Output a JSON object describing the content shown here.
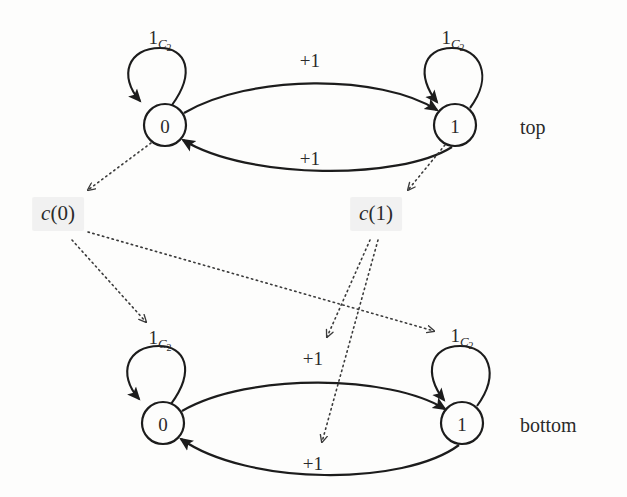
{
  "figure": {
    "type": "diagram",
    "background_color": "#fdfdfc",
    "ink_color": "#1c1c1c",
    "highlight_color": "#e8e8e8"
  },
  "graphs": [
    {
      "id": "top",
      "caption": "top",
      "caption_pos": {
        "x": 520,
        "y": 127
      },
      "nodes": [
        {
          "id": "top-0",
          "label": "0",
          "x": 165,
          "y": 125,
          "r": 21
        },
        {
          "id": "top-1",
          "label": "1",
          "x": 455,
          "y": 125,
          "r": 21
        }
      ],
      "self_loops": [
        {
          "id": "top-0-loop",
          "node": "top-0",
          "label": {
            "base": "1",
            "sub": "C",
            "subsub": "2"
          },
          "label_pos": {
            "x": 160,
            "y": 40
          }
        },
        {
          "id": "top-1-loop",
          "node": "top-1",
          "label": {
            "base": "1",
            "sub": "C",
            "subsub": "2"
          },
          "label_pos": {
            "x": 453,
            "y": 40
          }
        }
      ],
      "edges": [
        {
          "id": "top-0-to-1",
          "from": "top-0",
          "to": "top-1",
          "label": "+1",
          "label_pos": {
            "x": 310,
            "y": 60
          },
          "curve": "upper"
        },
        {
          "id": "top-1-to-0",
          "from": "top-1",
          "to": "top-0",
          "label": "+1",
          "label_pos": {
            "x": 310,
            "y": 158
          },
          "curve": "lower"
        }
      ]
    },
    {
      "id": "bottom",
      "caption": "bottom",
      "caption_pos": {
        "x": 520,
        "y": 425
      },
      "nodes": [
        {
          "id": "bot-0",
          "label": "0",
          "x": 163,
          "y": 423,
          "r": 21
        },
        {
          "id": "bot-1",
          "label": "1",
          "x": 462,
          "y": 423,
          "r": 21
        }
      ],
      "self_loops": [
        {
          "id": "bot-0-loop",
          "node": "bot-0",
          "label": {
            "base": "1",
            "sub": "C",
            "subsub": "2"
          },
          "label_pos": {
            "x": 160,
            "y": 340
          }
        },
        {
          "id": "bot-1-loop",
          "node": "bot-1",
          "label": {
            "base": "1",
            "sub": "C",
            "subsub": "2"
          },
          "label_pos": {
            "x": 462,
            "y": 338
          }
        }
      ],
      "edges": [
        {
          "id": "bot-0-to-1",
          "from": "bot-0",
          "to": "bot-1",
          "label": "+1",
          "label_pos": {
            "x": 313,
            "y": 358
          },
          "curve": "upper"
        },
        {
          "id": "bot-1-to-0",
          "from": "bot-1",
          "to": "bot-0",
          "label": "+1",
          "label_pos": {
            "x": 313,
            "y": 463
          },
          "curve": "lower"
        }
      ]
    }
  ],
  "mapping_labels": [
    {
      "id": "c-of-0",
      "text": "c(0)",
      "fn": "c",
      "arg": "0",
      "x": 58,
      "y": 214
    },
    {
      "id": "c-of-1",
      "text": "c(1)",
      "fn": "c",
      "arg": "1",
      "x": 376,
      "y": 214
    }
  ],
  "mapping_arrows": [
    {
      "id": "arrow-top0-to-c0",
      "from": "top-0",
      "to": "c-of-0",
      "style": "dotted",
      "path": "M 151,143 L 88,190"
    },
    {
      "id": "arrow-top1-to-c1",
      "from": "top-1",
      "to": "c-of-1",
      "style": "dotted",
      "path": "M 445,145 L 408,190"
    },
    {
      "id": "arrow-c0-to-bot0-loop-label",
      "from": "c-of-0",
      "to": "bot-0-loop",
      "style": "dotted",
      "path": "M 72,240 L 146,322"
    },
    {
      "id": "arrow-c0-to-bot1-loop-label",
      "from": "c-of-0",
      "to": "bot-1-loop",
      "style": "dotted",
      "path": "M 88,232 L 434,331"
    },
    {
      "id": "arrow-c1-to-bot-upper-plus1",
      "from": "c-of-1",
      "to": "bot-0-to-1",
      "style": "dotted",
      "path": "M 370,240 L 327,337"
    },
    {
      "id": "arrow-c1-to-bot-lower-plus1",
      "from": "c-of-1",
      "to": "bot-1-to-0",
      "style": "dotted",
      "path": "M 378,240 L 322,442"
    }
  ]
}
